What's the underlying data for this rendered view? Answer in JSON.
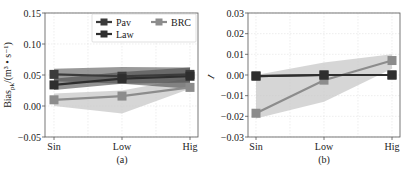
{
  "chart_data": [
    {
      "type": "line",
      "panel_label": "(a)",
      "xlabel": "",
      "ylabel": "Bias_pk/(m³ • s⁻¹)",
      "ylabel_main": "Bias",
      "ylabel_sub": "pk",
      "ylabel_unit": "/(m³ • s⁻¹)",
      "categories": [
        "Sin",
        "Low",
        "Hig"
      ],
      "ylim": [
        -0.05,
        0.15
      ],
      "yticks": [
        -0.05,
        0.0,
        0.05,
        0.1,
        0.15
      ],
      "ytick_labels": [
        "−0.05",
        "0.00",
        "0.05",
        "0.10",
        "0.15"
      ],
      "grid": true,
      "legend": {
        "position": "upper right",
        "columns": 2,
        "entries": [
          "Pav",
          "Law",
          "BRC"
        ]
      },
      "series": [
        {
          "name": "Pav",
          "values": [
            0.051,
            0.048,
            0.051
          ],
          "band_low": [
            0.04,
            0.036,
            0.038
          ],
          "band_high": [
            0.06,
            0.063,
            0.062
          ],
          "color": "#3b3b3b",
          "band_color": "#555555"
        },
        {
          "name": "Law",
          "values": [
            0.034,
            0.044,
            0.048
          ],
          "band_low": [
            0.026,
            0.036,
            0.028
          ],
          "band_high": [
            0.044,
            0.055,
            0.062
          ],
          "color": "#2e2e2e",
          "band_color": "#4a4a4a"
        },
        {
          "name": "BRC",
          "values": [
            0.01,
            0.016,
            0.03
          ],
          "band_low": [
            0.0,
            -0.012,
            0.028
          ],
          "band_high": [
            0.02,
            0.025,
            0.045
          ],
          "color": "#8c8c8c",
          "band_color": "#c8c8c8"
        }
      ]
    },
    {
      "type": "line",
      "panel_label": "(b)",
      "xlabel": "",
      "ylabel": "I",
      "categories": [
        "Sin",
        "Low",
        "Hig"
      ],
      "ylim": [
        -0.03,
        0.03
      ],
      "yticks": [
        -0.03,
        -0.02,
        -0.01,
        0.0,
        0.01,
        0.02,
        0.03
      ],
      "ytick_labels": [
        "−0.03",
        "−0.02",
        "−0.01",
        "0.00",
        "0.01",
        "0.02",
        "0.03"
      ],
      "grid": true,
      "series": [
        {
          "name": "Pav",
          "values": [
            -0.0005,
            0.0,
            0.0
          ],
          "color": "#3b3b3b"
        },
        {
          "name": "Law",
          "values": [
            -0.0005,
            0.0,
            0.0
          ],
          "color": "#2e2e2e"
        },
        {
          "name": "BRC",
          "values": [
            -0.0185,
            -0.0025,
            0.007
          ],
          "band_low": [
            -0.021,
            -0.013,
            0.003
          ],
          "band_high": [
            0.0,
            0.006,
            0.01
          ],
          "color": "#8c8c8c",
          "band_color": "#c8c8c8"
        }
      ]
    }
  ]
}
